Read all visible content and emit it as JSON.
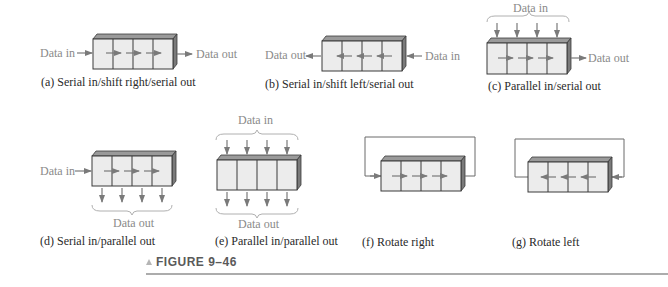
{
  "figure": {
    "label": "FIGURE 9–46",
    "marker_icon": "triangle-up-icon",
    "colors": {
      "text_gray": "#8a8a8a",
      "caption": "#2a2a2a",
      "register_face": "#ececec",
      "arrow": "#7a7a7a",
      "rule": "#5a5a5a"
    }
  },
  "panels": [
    {
      "id": "a",
      "caption": "(a) Serial in/shift right/serial out",
      "input_label": "Data in",
      "output_label": "Data out",
      "stages": 4,
      "direction": "right"
    },
    {
      "id": "b",
      "caption": "(b) Serial in/shift left/serial out",
      "input_label": "Data in",
      "output_label": "Data out",
      "stages": 4,
      "direction": "left"
    },
    {
      "id": "c",
      "caption": "(c) Parallel in/serial out",
      "input_label": "Data in",
      "output_label": "Data out",
      "stages": 4,
      "direction": "right"
    },
    {
      "id": "d",
      "caption": "(d) Serial in/parallel out",
      "input_label": "Data in",
      "output_label": "Data out",
      "stages": 4,
      "direction": "right"
    },
    {
      "id": "e",
      "caption": "(e) Parallel in/parallel out",
      "input_label": "Data in",
      "output_label": "Data out",
      "stages": 4,
      "direction": "none"
    },
    {
      "id": "f",
      "caption": "(f) Rotate right",
      "stages": 4,
      "direction": "right"
    },
    {
      "id": "g",
      "caption": "(g) Rotate left",
      "stages": 4,
      "direction": "left"
    }
  ]
}
